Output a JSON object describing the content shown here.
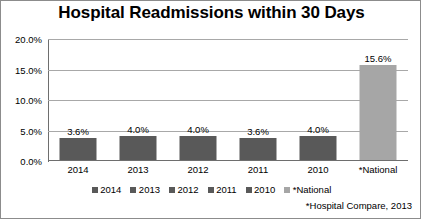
{
  "chart_data": {
    "type": "bar",
    "title": "Hospital Readmissions within 30 Days",
    "xlabel": "",
    "ylabel": "",
    "categories": [
      "2014",
      "2013",
      "2012",
      "2011",
      "2010",
      "*National"
    ],
    "values": [
      3.6,
      4.0,
      4.0,
      3.6,
      4.0,
      15.6
    ],
    "value_labels": [
      "3.6%",
      "4.0%",
      "4.0%",
      "3.6%",
      "4.0%",
      "15.6%"
    ],
    "ylim": [
      0,
      20
    ],
    "ytick_labels": [
      "20.0%",
      "15.0%",
      "10.0%",
      "5.0%",
      "0.0%"
    ],
    "ytick_values": [
      20,
      15,
      10,
      5,
      0
    ],
    "grid": true,
    "legend_position": "bottom",
    "legend": [
      {
        "label": "2014",
        "color": "#595959"
      },
      {
        "label": "2013",
        "color": "#595959"
      },
      {
        "label": "2012",
        "color": "#595959"
      },
      {
        "label": "2011",
        "color": "#595959"
      },
      {
        "label": "2010",
        "color": "#595959"
      },
      {
        "label": "*National",
        "color": "#a6a6a6"
      }
    ],
    "bar_colors": [
      "#595959",
      "#595959",
      "#595959",
      "#595959",
      "#595959",
      "#a6a6a6"
    ],
    "annotations": [
      "*Hospital Compare, 2013"
    ]
  },
  "footnote": "*Hospital Compare, 2013",
  "colors": {
    "bar_year": "#595959",
    "bar_national": "#a6a6a6",
    "gridline": "#a8a8a8",
    "axis": "#6e6e6e",
    "frame": "#8c8c8c",
    "text": "#000000"
  }
}
